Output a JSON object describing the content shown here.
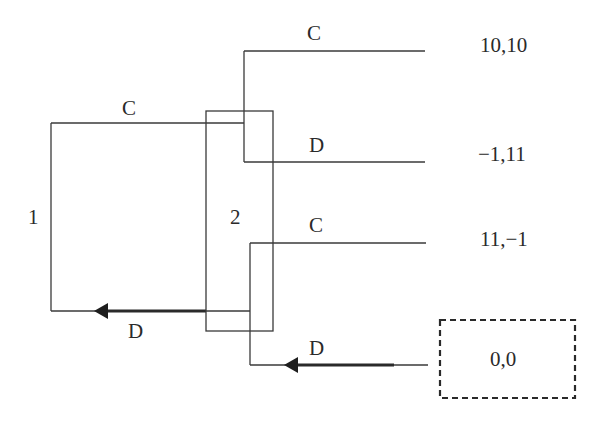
{
  "diagram": {
    "type": "extensive-form game tree (prisoner's dilemma, simultaneous moves)",
    "players": [
      {
        "id": "1",
        "label": "1"
      },
      {
        "id": "2",
        "label": "2"
      }
    ],
    "player1": {
      "label": "1",
      "actions": [
        {
          "label": "C",
          "highlighted": false
        },
        {
          "label": "D",
          "highlighted": true
        }
      ]
    },
    "player2": {
      "label": "2",
      "information_set": "single information set enclosing both decision nodes",
      "upper_node": {
        "actions": [
          {
            "label": "C",
            "highlighted": false
          },
          {
            "label": "D",
            "highlighted": false
          }
        ]
      },
      "lower_node": {
        "actions": [
          {
            "label": "C",
            "highlighted": false
          },
          {
            "label": "D",
            "highlighted": true
          }
        ]
      }
    },
    "payoffs": [
      {
        "path": "C,C",
        "label": "10,10",
        "equilibrium": false
      },
      {
        "path": "C,D",
        "label": "−1,11",
        "equilibrium": false
      },
      {
        "path": "D,C",
        "label": "11,−1",
        "equilibrium": false
      },
      {
        "path": "D,D",
        "label": "0,0",
        "equilibrium": true
      }
    ],
    "colors": {
      "line": "#3a3a3a",
      "text": "#2a2a2a",
      "background": "#ffffff"
    }
  }
}
